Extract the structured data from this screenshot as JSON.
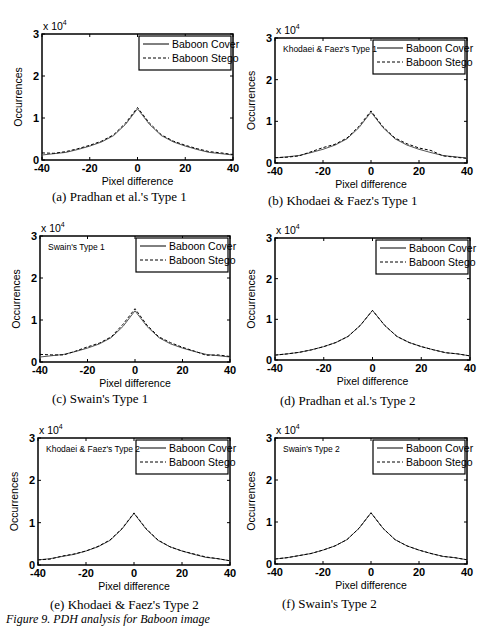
{
  "figure_caption": "Figure  9. PDH analysis for Baboon image",
  "chart_data": [
    {
      "type": "line",
      "id": "a",
      "caption": "(a)  Pradhan et al.'s Type 1",
      "annotation": "",
      "title": "",
      "xlabel": "Pixel difference",
      "ylabel": "Occurrences",
      "y_multiplier": "x 10^4",
      "xlim": [
        -40,
        40
      ],
      "ylim": [
        0,
        3
      ],
      "xticks": [
        -40,
        -20,
        0,
        20,
        40
      ],
      "yticks": [
        0,
        1,
        2,
        3
      ],
      "legend": [
        "Baboon Cover",
        "Baboon Stego"
      ],
      "legend_position": "upper right",
      "x": [
        -40,
        -35,
        -30,
        -25,
        -20,
        -15,
        -10,
        -5,
        0,
        5,
        10,
        15,
        20,
        25,
        30,
        35,
        40
      ],
      "series": [
        {
          "name": "Baboon Cover",
          "style": "solid",
          "values": [
            0.12,
            0.15,
            0.18,
            0.25,
            0.33,
            0.43,
            0.58,
            0.85,
            1.22,
            0.85,
            0.58,
            0.43,
            0.33,
            0.25,
            0.18,
            0.15,
            0.12
          ]
        },
        {
          "name": "Baboon Stego",
          "style": "dashed",
          "values": [
            0.17,
            0.16,
            0.2,
            0.27,
            0.35,
            0.45,
            0.6,
            0.88,
            1.25,
            0.88,
            0.6,
            0.45,
            0.35,
            0.27,
            0.2,
            0.17,
            0.13
          ]
        }
      ]
    },
    {
      "type": "line",
      "id": "b",
      "caption": "(b)  Khodaei & Faez's Type 1",
      "annotation": "Khodaei & Faez's Type 1",
      "xlabel": "Pixel difference",
      "ylabel": "Occurrences",
      "y_multiplier": "x 10^4",
      "xlim": [
        -40,
        40
      ],
      "ylim": [
        0,
        3
      ],
      "xticks": [
        -40,
        -20,
        0,
        20,
        40
      ],
      "yticks": [
        0,
        1,
        2,
        3
      ],
      "legend": [
        "Baboon Cover",
        "Baboon Stego"
      ],
      "legend_position": "upper right",
      "x": [
        -40,
        -35,
        -30,
        -25,
        -20,
        -15,
        -10,
        -5,
        0,
        5,
        10,
        15,
        20,
        25,
        30,
        35,
        40
      ],
      "series": [
        {
          "name": "Baboon Cover",
          "style": "solid",
          "values": [
            0.12,
            0.15,
            0.18,
            0.25,
            0.33,
            0.43,
            0.58,
            0.85,
            1.22,
            0.85,
            0.58,
            0.43,
            0.33,
            0.25,
            0.18,
            0.15,
            0.12
          ]
        },
        {
          "name": "Baboon Stego",
          "style": "dashed",
          "values": [
            0.13,
            0.14,
            0.17,
            0.27,
            0.37,
            0.45,
            0.6,
            0.88,
            1.25,
            0.87,
            0.6,
            0.46,
            0.36,
            0.3,
            0.17,
            0.14,
            0.11
          ]
        }
      ]
    },
    {
      "type": "line",
      "id": "c",
      "caption": "(c)  Swain's Type 1",
      "annotation": "Swain's Type 1",
      "xlabel": "Pixel difference",
      "ylabel": "Occurrences",
      "y_multiplier": "x 10^4",
      "xlim": [
        -40,
        40
      ],
      "ylim": [
        0,
        3
      ],
      "xticks": [
        -40,
        -20,
        0,
        20,
        40
      ],
      "yticks": [
        0,
        1,
        2,
        3
      ],
      "legend": [
        "Baboon Cover",
        "Baboon Stego"
      ],
      "legend_position": "upper right",
      "x": [
        -40,
        -35,
        -30,
        -25,
        -20,
        -15,
        -10,
        -5,
        0,
        5,
        10,
        15,
        20,
        25,
        30,
        35,
        40
      ],
      "series": [
        {
          "name": "Baboon Cover",
          "style": "solid",
          "values": [
            0.12,
            0.15,
            0.18,
            0.25,
            0.33,
            0.43,
            0.58,
            0.85,
            1.22,
            0.85,
            0.58,
            0.43,
            0.33,
            0.25,
            0.18,
            0.15,
            0.12
          ]
        },
        {
          "name": "Baboon Stego",
          "style": "dashed",
          "values": [
            0.18,
            0.17,
            0.17,
            0.26,
            0.36,
            0.45,
            0.6,
            0.9,
            1.27,
            0.88,
            0.6,
            0.46,
            0.35,
            0.26,
            0.16,
            0.17,
            0.13
          ]
        }
      ]
    },
    {
      "type": "line",
      "id": "d",
      "caption": "(d)  Pradhan et al.'s Type 2",
      "annotation": "",
      "xlabel": "Pixel difference",
      "ylabel": "Occurrences",
      "y_multiplier": "x 10^4",
      "xlim": [
        -40,
        40
      ],
      "ylim": [
        0,
        3
      ],
      "xticks": [
        -40,
        -20,
        0,
        20,
        40
      ],
      "yticks": [
        0,
        1,
        2,
        3
      ],
      "legend": [
        "Baboon Cover",
        "Baboon Stego"
      ],
      "legend_position": "upper right",
      "x": [
        -40,
        -35,
        -30,
        -25,
        -20,
        -15,
        -10,
        -5,
        0,
        5,
        10,
        15,
        20,
        25,
        30,
        35,
        40
      ],
      "series": [
        {
          "name": "Baboon Cover",
          "style": "solid",
          "values": [
            0.12,
            0.15,
            0.19,
            0.25,
            0.33,
            0.43,
            0.58,
            0.85,
            1.22,
            0.85,
            0.58,
            0.43,
            0.33,
            0.25,
            0.18,
            0.15,
            0.1
          ]
        },
        {
          "name": "Baboon Stego",
          "style": "dashed",
          "values": [
            0.12,
            0.15,
            0.19,
            0.25,
            0.33,
            0.43,
            0.58,
            0.85,
            1.22,
            0.85,
            0.58,
            0.43,
            0.33,
            0.25,
            0.18,
            0.15,
            0.1
          ]
        }
      ]
    },
    {
      "type": "line",
      "id": "e",
      "caption": "(e)  Khodaei & Faez's Type 2",
      "annotation": "Khodaei & Faez's Type 2",
      "xlabel": "Pixel difference",
      "ylabel": "Occurrences",
      "y_multiplier": "x 10^4",
      "xlim": [
        -40,
        40
      ],
      "ylim": [
        0,
        3
      ],
      "xticks": [
        -40,
        -20,
        0,
        20,
        40
      ],
      "yticks": [
        0,
        1,
        2,
        3
      ],
      "legend": [
        "Baboon Cover",
        "Baboon Stego"
      ],
      "legend_position": "upper right",
      "x": [
        -40,
        -35,
        -30,
        -25,
        -20,
        -15,
        -10,
        -5,
        0,
        5,
        10,
        15,
        20,
        25,
        30,
        35,
        40
      ],
      "series": [
        {
          "name": "Baboon Cover",
          "style": "solid",
          "values": [
            0.12,
            0.15,
            0.2,
            0.25,
            0.33,
            0.43,
            0.58,
            0.85,
            1.22,
            0.85,
            0.58,
            0.43,
            0.33,
            0.25,
            0.18,
            0.15,
            0.1
          ]
        },
        {
          "name": "Baboon Stego",
          "style": "dashed",
          "values": [
            0.12,
            0.14,
            0.21,
            0.26,
            0.33,
            0.44,
            0.59,
            0.86,
            1.23,
            0.86,
            0.59,
            0.43,
            0.33,
            0.26,
            0.19,
            0.15,
            0.1
          ]
        }
      ]
    },
    {
      "type": "line",
      "id": "f",
      "caption": "(f)  Swain's Type 2",
      "annotation": "Swain's Type 2",
      "xlabel": "Pixel difference",
      "ylabel": "Occurrences",
      "y_multiplier": "x 10^4",
      "xlim": [
        -40,
        40
      ],
      "ylim": [
        0,
        3
      ],
      "xticks": [
        -40,
        -20,
        0,
        20,
        40
      ],
      "yticks": [
        0,
        1,
        2,
        3
      ],
      "legend": [
        "Baboon Cover",
        "Baboon Stego"
      ],
      "legend_position": "upper right",
      "x": [
        -40,
        -35,
        -30,
        -25,
        -20,
        -15,
        -10,
        -5,
        0,
        5,
        10,
        15,
        20,
        25,
        30,
        35,
        40
      ],
      "series": [
        {
          "name": "Baboon Cover",
          "style": "solid",
          "values": [
            0.12,
            0.15,
            0.2,
            0.25,
            0.33,
            0.43,
            0.58,
            0.85,
            1.22,
            0.85,
            0.58,
            0.43,
            0.33,
            0.25,
            0.18,
            0.15,
            0.1
          ]
        },
        {
          "name": "Baboon Stego",
          "style": "dashed",
          "values": [
            0.12,
            0.15,
            0.2,
            0.25,
            0.33,
            0.43,
            0.58,
            0.85,
            1.22,
            0.85,
            0.58,
            0.43,
            0.33,
            0.25,
            0.18,
            0.15,
            0.1
          ]
        }
      ]
    }
  ],
  "layout": {
    "panels": [
      {
        "left": 0,
        "top": 0,
        "box": [
          42,
          34,
          233,
          160
        ],
        "cap": [
          52,
          189
        ]
      },
      {
        "left": 245,
        "top": 0,
        "box": [
          30,
          38,
          222,
          163
        ],
        "cap": [
          23,
          193
        ]
      },
      {
        "left": 0,
        "top": 210,
        "box": [
          40,
          26,
          230,
          152
        ],
        "cap": [
          52,
          181
        ]
      },
      {
        "left": 245,
        "top": 210,
        "box": [
          30,
          28,
          225,
          150
        ],
        "cap": [
          35,
          183
        ]
      },
      {
        "left": 0,
        "top": 420,
        "box": [
          38,
          18,
          230,
          145
        ],
        "cap": [
          50,
          177
        ]
      },
      {
        "left": 245,
        "top": 420,
        "box": [
          30,
          18,
          222,
          144
        ],
        "cap": [
          37,
          176
        ]
      }
    ]
  }
}
